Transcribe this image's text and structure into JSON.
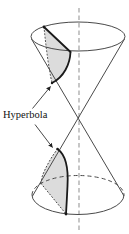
{
  "figure": {
    "label": "Hyperbola",
    "colors": {
      "outline": "#4a4a4a",
      "cut_line": "#1a1a1a",
      "hidden": "#444444",
      "axis": "#999999",
      "shade": "#dcdcdc",
      "arrow": "#333333",
      "text": "#111111",
      "background": "#ffffff"
    }
  }
}
